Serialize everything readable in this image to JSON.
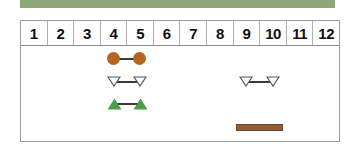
{
  "figure": {
    "title_bar": {
      "name": "green-banner",
      "color": "#8FA87A"
    },
    "table": {
      "border_color": "#9d9d9d",
      "background": "#ffffff"
    }
  },
  "chart_data": {
    "type": "table",
    "title": "",
    "subtitle": "",
    "xlabel": "",
    "ylabel": "",
    "grid": true,
    "legend_position": "none",
    "axis_range": [
      1,
      12
    ],
    "categories": [
      "1",
      "2",
      "3",
      "4",
      "5",
      "6",
      "7",
      "8",
      "9",
      "10",
      "11",
      "12"
    ],
    "column_headers": [
      "1",
      "2",
      "3",
      "4",
      "5",
      "6",
      "7",
      "8",
      "9",
      "10",
      "11",
      "12"
    ],
    "annotations": [],
    "series": [
      {
        "name": "brown-circle-range",
        "marker": "circle-filled",
        "color": "#B5651D",
        "start": 4,
        "end": 5,
        "row": 1,
        "label": ""
      },
      {
        "name": "open-triangle-range-left",
        "marker": "triangle-down-open",
        "color": "#ffffff",
        "outline": "#555555",
        "start": 4,
        "end": 5,
        "row": 2,
        "label": ""
      },
      {
        "name": "green-triangle-range",
        "marker": "triangle-up-filled",
        "color": "#4A9E4A",
        "start": 4,
        "end": 5,
        "row": 3,
        "label": ""
      },
      {
        "name": "open-triangle-range-right",
        "marker": "triangle-down-open",
        "color": "#ffffff",
        "outline": "#555555",
        "start": 9,
        "end": 10,
        "row": 2,
        "label": ""
      },
      {
        "name": "brown-bar-range",
        "marker": "bar-solid",
        "color": "#8B5E3C",
        "start": 9,
        "end": 10,
        "row": 4,
        "label": ""
      }
    ]
  }
}
